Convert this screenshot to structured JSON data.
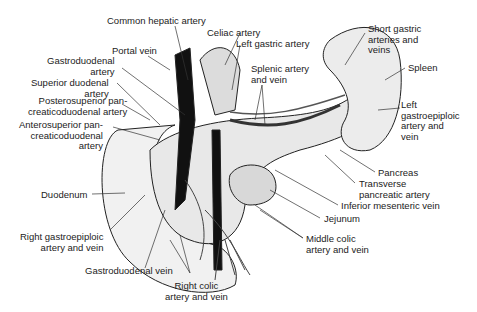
{
  "figure": {
    "labels": {
      "common_hepatic_artery": "Common hepatic artery",
      "celiac_artery": "Celiac artery",
      "left_gastric_artery": "Left gastric artery",
      "portal_vein": "Portal vein",
      "gastroduodenal_artery": "Gastroduodenal\nartery",
      "superior_duodenal_artery": "Superior duodenal\nartery",
      "posterosuperior_pd_artery": "Posterosuperior pan-\ncreaticoduodenal artery",
      "anterosuperior_pd_artery": "Anterosuperior pan-\ncreaticoduodenal\nartery",
      "splenic_artery_vein": "Splenic artery\nand vein",
      "short_gastric": "Short gastric\narteries and\nveins",
      "spleen": "Spleen",
      "left_gastroepiploic": "Left\ngastroepiploic\nartery and\nvein",
      "pancreas": "Pancreas",
      "transverse_pancreatic_artery": "Transverse\npancreatic artery",
      "inferior_mesenteric_vein": "Inferior mesenteric vein",
      "jejunum": "Jejunum",
      "middle_colic": "Middle colic\nartery and vein",
      "duodenum": "Duodenum",
      "right_gastroepiploic": "Right gastroepiploic\nartery and vein",
      "gastroduodenal_vein": "Gastroduodenal vein",
      "right_colic": "Right colic\nartery and vein"
    }
  }
}
